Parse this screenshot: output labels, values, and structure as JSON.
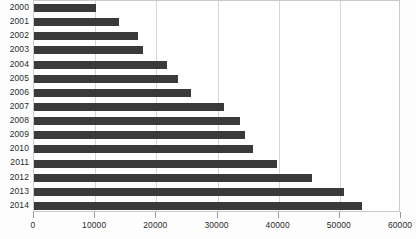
{
  "chart_data": {
    "type": "bar",
    "orientation": "horizontal",
    "title": "",
    "subtitle": "",
    "xlabel": "",
    "ylabel": "",
    "xlim": [
      0,
      60000
    ],
    "ylim": null,
    "grid": true,
    "legend": null,
    "legend_position": "none",
    "xticks": [
      0,
      10000,
      20000,
      30000,
      40000,
      50000,
      60000
    ],
    "xtick_labels": [
      "0",
      "10000",
      "20000",
      "30000",
      "40000",
      "50000",
      "60000"
    ],
    "categories": [
      "2000",
      "2001",
      "2002",
      "2003",
      "2004",
      "2005",
      "2006",
      "2007",
      "2008",
      "2009",
      "2010",
      "2011",
      "2012",
      "2013",
      "2014"
    ],
    "values": [
      10100,
      13900,
      17000,
      17900,
      21700,
      23600,
      25700,
      31000,
      33700,
      34500,
      35800,
      39800,
      45500,
      50700,
      53700
    ],
    "bar_color": "#3a3a3a",
    "grid_color": "#d6d6d6",
    "axis_color": "#c9c9c9",
    "background_color": "#ffffff"
  }
}
